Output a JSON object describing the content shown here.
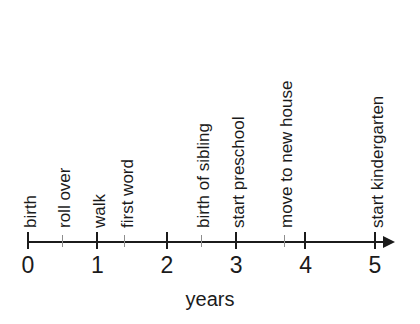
{
  "chart_data": {
    "type": "scatter",
    "title": "",
    "xlabel": "years",
    "ylabel": "",
    "xlim": [
      0,
      5
    ],
    "grid": false,
    "legend": null,
    "orientation": "horizontal-timeline",
    "axis_label": "years",
    "tick_labels": [
      "0",
      "1",
      "2",
      "3",
      "4",
      "5"
    ],
    "tick_values": [
      0,
      1,
      2,
      3,
      4,
      5
    ],
    "minor_tick_values": [
      0.5,
      1.4,
      2.5,
      3.7
    ],
    "categories": [
      "birth",
      "roll over",
      "walk",
      "first word",
      "birth of sibling",
      "start preschool",
      "move to new house",
      "start kindergarten"
    ],
    "values": [
      0,
      0.5,
      1,
      1.4,
      2.5,
      3,
      3.7,
      5
    ],
    "events": [
      {
        "label": "birth",
        "year": 0,
        "tick": "major"
      },
      {
        "label": "roll over",
        "year": 0.5,
        "tick": "minor"
      },
      {
        "label": "walk",
        "year": 1,
        "tick": "major"
      },
      {
        "label": "first word",
        "year": 1.4,
        "tick": "minor"
      },
      {
        "label": "birth of sibling",
        "year": 2.5,
        "tick": "minor"
      },
      {
        "label": "start preschool",
        "year": 3,
        "tick": "major"
      },
      {
        "label": "move to new house",
        "year": 3.7,
        "tick": "minor"
      },
      {
        "label": "start kindergarten",
        "year": 5,
        "tick": "major"
      }
    ],
    "colors": {
      "ink": "#1b1b1b",
      "minor_tick": "#8e8e8e",
      "background": "#ffffff"
    }
  }
}
